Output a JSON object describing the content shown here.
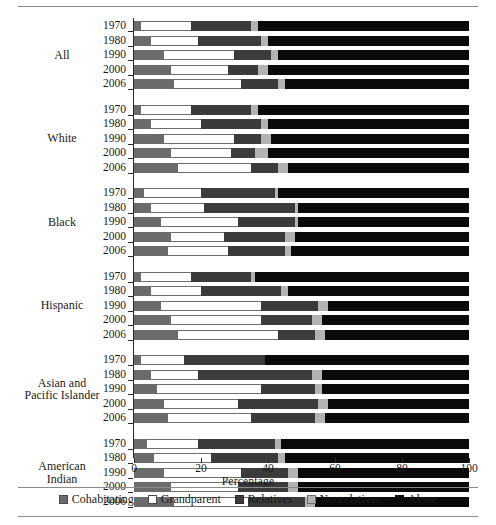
{
  "chart_data": {
    "type": "bar",
    "subtype": "horizontal-stacked-bar",
    "title": "",
    "xlabel": "Percentage",
    "ylabel": "",
    "xlim": [
      0,
      100
    ],
    "xticks": [
      0,
      20,
      40,
      60,
      80,
      100
    ],
    "grid": false,
    "legend_position": "bottom",
    "series": [
      {
        "name": "Cohabitating",
        "color": "#6b6b6b"
      },
      {
        "name": "Grandparent",
        "color": "#ffffff"
      },
      {
        "name": "Relatives",
        "color": "#3b3b3b"
      },
      {
        "name": "Nonrelatives",
        "color": "#b3b3b3"
      },
      {
        "name": "Alone",
        "color": "#0a0a0a"
      }
    ],
    "groups": [
      {
        "label": "All",
        "rows": [
          {
            "year": "1970",
            "values": [
              2,
              15,
              18,
              2,
              63
            ]
          },
          {
            "year": "1980",
            "values": [
              5,
              14,
              19,
              2,
              60
            ]
          },
          {
            "year": "1990",
            "values": [
              9,
              21,
              11,
              2,
              57
            ]
          },
          {
            "year": "2000",
            "values": [
              11,
              17,
              9,
              3,
              60
            ]
          },
          {
            "year": "2006",
            "values": [
              12,
              20,
              11,
              2,
              55
            ]
          }
        ]
      },
      {
        "label": "White",
        "rows": [
          {
            "year": "1970",
            "values": [
              2,
              15,
              18,
              2,
              63
            ]
          },
          {
            "year": "1980",
            "values": [
              5,
              15,
              18,
              2,
              60
            ]
          },
          {
            "year": "1990",
            "values": [
              9,
              21,
              8,
              3,
              59
            ]
          },
          {
            "year": "2000",
            "values": [
              11,
              18,
              7,
              4,
              60
            ]
          },
          {
            "year": "2006",
            "values": [
              13,
              22,
              8,
              3,
              54
            ]
          }
        ]
      },
      {
        "label": "Black",
        "rows": [
          {
            "year": "1970",
            "values": [
              3,
              17,
              22,
              1,
              57
            ]
          },
          {
            "year": "1980",
            "values": [
              5,
              16,
              27,
              1,
              51
            ]
          },
          {
            "year": "1990",
            "values": [
              8,
              23,
              17,
              1,
              51
            ]
          },
          {
            "year": "2000",
            "values": [
              11,
              16,
              18,
              3,
              52
            ]
          },
          {
            "year": "2006",
            "values": [
              10,
              18,
              17,
              2,
              53
            ]
          }
        ]
      },
      {
        "label": "Hispanic",
        "rows": [
          {
            "year": "1970",
            "values": [
              2,
              15,
              18,
              1,
              64
            ]
          },
          {
            "year": "1980",
            "values": [
              5,
              15,
              24,
              2,
              54
            ]
          },
          {
            "year": "1990",
            "values": [
              8,
              30,
              17,
              3,
              42
            ]
          },
          {
            "year": "2000",
            "values": [
              11,
              27,
              15,
              3,
              44
            ]
          },
          {
            "year": "2006",
            "values": [
              13,
              30,
              11,
              3,
              43
            ]
          }
        ]
      },
      {
        "label": "Asian and\nPacific Islander",
        "rows": [
          {
            "year": "1970",
            "values": [
              2,
              13,
              24,
              0,
              61
            ]
          },
          {
            "year": "1980",
            "values": [
              5,
              14,
              34,
              3,
              44
            ]
          },
          {
            "year": "1990",
            "values": [
              7,
              31,
              16,
              2,
              44
            ]
          },
          {
            "year": "2000",
            "values": [
              9,
              22,
              24,
              3,
              42
            ]
          },
          {
            "year": "2006",
            "values": [
              10,
              25,
              19,
              3,
              43
            ]
          }
        ]
      },
      {
        "label": "American\nIndian",
        "rows": [
          {
            "year": "1970",
            "values": [
              4,
              15,
              23,
              2,
              56
            ]
          },
          {
            "year": "1980",
            "values": [
              6,
              17,
              20,
              2,
              55
            ]
          },
          {
            "year": "1990",
            "values": [
              9,
              23,
              14,
              3,
              51
            ]
          },
          {
            "year": "2000",
            "values": [
              11,
              20,
              15,
              3,
              51
            ]
          },
          {
            "year": "2006",
            "values": [
              12,
              22,
              17,
              3,
              46
            ]
          }
        ]
      }
    ]
  },
  "axis": {
    "x_title": "Percentage",
    "x_tick_labels": [
      "0",
      "20",
      "40",
      "60",
      "80",
      "100"
    ]
  },
  "legend": {
    "items": [
      {
        "label": "Cohabitating",
        "key": "cohab"
      },
      {
        "label": "Grandparent",
        "key": "grand"
      },
      {
        "label": "Relatives",
        "key": "rel"
      },
      {
        "label": "Nonrelatives",
        "key": "nonrel"
      },
      {
        "label": "Alone",
        "key": "alone"
      }
    ]
  }
}
